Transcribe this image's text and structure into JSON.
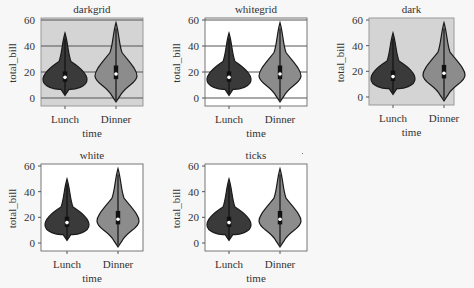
{
  "chart_data": [
    {
      "type": "violin",
      "title": "darkgrid",
      "style": "darkgrid",
      "xlabel": "time",
      "ylabel": "total_bill",
      "categories": [
        "Lunch",
        "Dinner"
      ],
      "yticks": [
        0,
        20,
        40,
        60
      ],
      "ylim": [
        -4,
        62
      ],
      "grid": true,
      "background": "#d4d4d4",
      "series": [
        {
          "name": "Lunch",
          "color": "#3a3a3a",
          "min": 2,
          "q1": 12.5,
          "median": 15.9,
          "q3": 20.5,
          "max": 50,
          "peak": 14
        },
        {
          "name": "Dinner",
          "color": "#8c8c8c",
          "min": -3,
          "q1": 14.5,
          "median": 18.5,
          "q3": 25.0,
          "max": 58,
          "peak": 17
        }
      ]
    },
    {
      "type": "violin",
      "title": "whitegrid",
      "style": "whitegrid",
      "xlabel": "time",
      "ylabel": "total_bill",
      "categories": [
        "Lunch",
        "Dinner"
      ],
      "yticks": [
        0,
        20,
        40,
        60
      ],
      "ylim": [
        -4,
        62
      ],
      "grid": true,
      "background": "#ffffff",
      "series": [
        {
          "name": "Lunch",
          "color": "#3a3a3a",
          "min": 2,
          "q1": 12.5,
          "median": 15.9,
          "q3": 20.5,
          "max": 50,
          "peak": 14
        },
        {
          "name": "Dinner",
          "color": "#8c8c8c",
          "min": -3,
          "q1": 14.5,
          "median": 18.5,
          "q3": 25.0,
          "max": 58,
          "peak": 17
        }
      ]
    },
    {
      "type": "violin",
      "title": "dark",
      "style": "dark",
      "xlabel": "time",
      "ylabel": "total_bill",
      "categories": [
        "Lunch",
        "Dinner"
      ],
      "yticks": [
        0,
        20,
        40,
        60
      ],
      "ylim": [
        -4,
        62
      ],
      "grid": false,
      "background": "#d4d4d4",
      "series": [
        {
          "name": "Lunch",
          "color": "#3a3a3a",
          "min": 2,
          "q1": 12.5,
          "median": 15.9,
          "q3": 20.5,
          "max": 50,
          "peak": 14
        },
        {
          "name": "Dinner",
          "color": "#8c8c8c",
          "min": -3,
          "q1": 14.5,
          "median": 18.5,
          "q3": 25.0,
          "max": 58,
          "peak": 17
        }
      ]
    },
    {
      "type": "violin",
      "title": "white",
      "style": "white",
      "xlabel": "time",
      "ylabel": "total_bill",
      "categories": [
        "Lunch",
        "Dinner"
      ],
      "yticks": [
        0,
        20,
        40,
        60
      ],
      "ylim": [
        -4,
        62
      ],
      "grid": false,
      "background": "#ffffff",
      "series": [
        {
          "name": "Lunch",
          "color": "#3a3a3a",
          "min": 2,
          "q1": 12.5,
          "median": 15.9,
          "q3": 20.5,
          "max": 50,
          "peak": 14
        },
        {
          "name": "Dinner",
          "color": "#8c8c8c",
          "min": -3,
          "q1": 14.5,
          "median": 18.5,
          "q3": 25.0,
          "max": 58,
          "peak": 17
        }
      ]
    },
    {
      "type": "violin",
      "title": "ticks",
      "style": "ticks",
      "xlabel": "time",
      "ylabel": "total_bill",
      "categories": [
        "Lunch",
        "Dinner"
      ],
      "yticks": [
        0,
        20,
        40,
        60
      ],
      "ylim": [
        -4,
        62
      ],
      "grid": false,
      "background": "#ffffff",
      "series": [
        {
          "name": "Lunch",
          "color": "#3a3a3a",
          "min": 2,
          "q1": 12.5,
          "median": 15.9,
          "q3": 20.5,
          "max": 50,
          "peak": 14
        },
        {
          "name": "Dinner",
          "color": "#8c8c8c",
          "min": -3,
          "q1": 14.5,
          "median": 18.5,
          "q3": 25.0,
          "max": 58,
          "peak": 17
        }
      ]
    }
  ],
  "panels": [
    {
      "title": "darkgrid",
      "xlabel": "time",
      "ylabel": "total_bill",
      "xticks": [
        "Lunch",
        "Dinner"
      ],
      "yticks": [
        "0",
        "20",
        "40",
        "60"
      ]
    },
    {
      "title": "whitegrid",
      "xlabel": "time",
      "ylabel": "total_bill",
      "xticks": [
        "Lunch",
        "Dinner"
      ],
      "yticks": [
        "0",
        "20",
        "40",
        "60"
      ]
    },
    {
      "title": "dark",
      "xlabel": "time",
      "ylabel": "total_bill",
      "xticks": [
        "Lunch",
        "Dinner"
      ],
      "yticks": [
        "0",
        "20",
        "40",
        "60"
      ]
    },
    {
      "title": "white",
      "xlabel": "time",
      "ylabel": "total_bill",
      "xticks": [
        "Lunch",
        "Dinner"
      ],
      "yticks": [
        "0",
        "20",
        "40",
        "60"
      ]
    },
    {
      "title": "ticks",
      "xlabel": "time",
      "ylabel": "total_bill",
      "xticks": [
        "Lunch",
        "Dinner"
      ],
      "yticks": [
        "0",
        "20",
        "40",
        "60"
      ]
    }
  ],
  "colors": {
    "lunch_violin": "#3a3a3a",
    "dinner_violin": "#8c8c8c",
    "dark_bg": "#d4d4d4",
    "grid_line": "#555555",
    "axis": "#666666"
  }
}
